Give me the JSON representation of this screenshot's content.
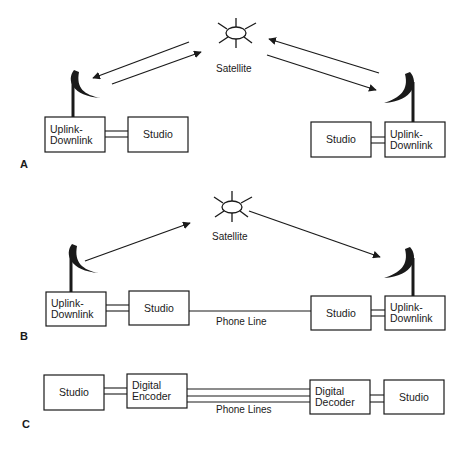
{
  "page_number": "",
  "panels": [
    {
      "letter": "A",
      "satellite_label": "Satellite",
      "left_station": {
        "uplink": [
          "Uplink-",
          "Downlink"
        ],
        "studio": "Studio"
      },
      "right_station": {
        "uplink": [
          "Uplink-",
          "Downlink"
        ],
        "studio": "Studio"
      },
      "links": "Bidirectional satellite links (up and down) between each uplink-downlink dish and the satellite"
    },
    {
      "letter": "B",
      "satellite_label": "Satellite",
      "left_station": {
        "uplink": [
          "Uplink-",
          "Downlink"
        ],
        "studio": "Studio"
      },
      "right_station": {
        "uplink": [
          "Uplink-",
          "Downlink"
        ],
        "studio": "Studio"
      },
      "phone_line_label": "Phone Line",
      "links": "One-way satellite path left dish -> satellite -> right dish, with return phone line between studios"
    },
    {
      "letter": "C",
      "left_studio": "Studio",
      "encoder": [
        "Digital",
        "Encoder"
      ],
      "decoder": [
        "Digital",
        "Decoder"
      ],
      "right_studio": "Studio",
      "phone_lines_label": "Phone Lines"
    }
  ],
  "colors": {
    "ink": "#1a1a1a",
    "background": "#ffffff"
  }
}
